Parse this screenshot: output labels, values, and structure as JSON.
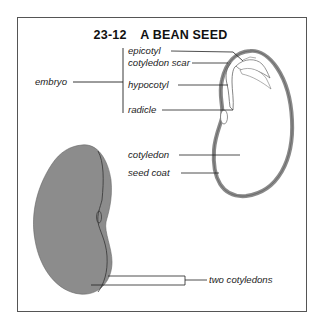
{
  "figure": {
    "number": "23-12",
    "title": "A BEAN SEED"
  },
  "labels": {
    "embryo": "embryo",
    "epicotyl": "epicotyl",
    "cotyledon_scar": "cotyledon scar",
    "hypocotyl": "hypocotyl",
    "radicle": "radicle",
    "cotyledon": "cotyledon",
    "seed_coat": "seed coat",
    "two_cotyledons": "two cotyledons"
  },
  "colors": {
    "seed_coat": "#8a8a8a",
    "bean_fill": "#8c8c8c",
    "line": "#222222",
    "frame": "#555555"
  }
}
